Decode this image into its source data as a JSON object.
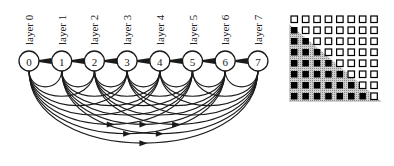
{
  "diagram": {
    "layers": [
      {
        "id": 0,
        "label": "layer 0",
        "node_text": "0"
      },
      {
        "id": 1,
        "label": "layer 1",
        "node_text": "1"
      },
      {
        "id": 2,
        "label": "layer 2",
        "node_text": "2"
      },
      {
        "id": 3,
        "label": "layer 3",
        "node_text": "3"
      },
      {
        "id": 4,
        "label": "layer 4",
        "node_text": "4"
      },
      {
        "id": 5,
        "label": "layer 5",
        "node_text": "5"
      },
      {
        "id": 6,
        "label": "layer 6",
        "node_text": "6"
      },
      {
        "id": 7,
        "label": "layer 7",
        "node_text": "7"
      }
    ],
    "connectivity": "each layer i connects to every later layer j > i (dense skip connections)",
    "matrix": {
      "size": 8,
      "filled_rule": "lower triangle (col < row) filled black, others hollow",
      "shade_color": "#b8b8b8"
    },
    "colors": {
      "stroke": "#1a1a1a",
      "background": "#ffffff"
    }
  }
}
